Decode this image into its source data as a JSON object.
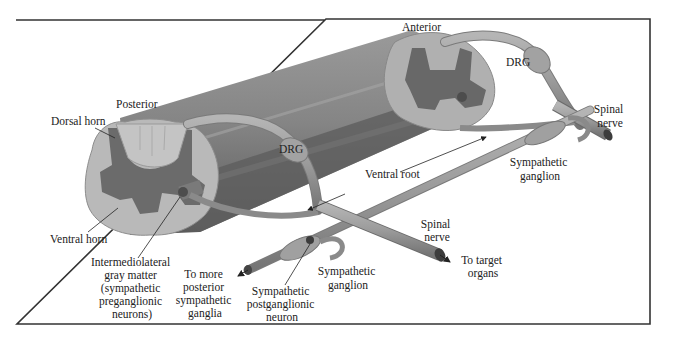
{
  "figure": {
    "colors": {
      "frame": "#333333",
      "white_matter": "#b9b9b9",
      "gray_matter": "#6e6e6e",
      "cord_body": "#8c8c8c",
      "cord_dark": "#5f5f5f",
      "nerve": "#9a9a9a",
      "nerve_edge": "#6a6a6a",
      "text": "#222222"
    },
    "labels": {
      "posterior": "Posterior",
      "anterior": "Anterior",
      "dorsal_horn": "Dorsal horn",
      "ventral_horn": "Ventral horn",
      "drg_left": "DRG",
      "drg_right": "DRG",
      "ventral_root": "Ventral root",
      "spinal_nerve_top": [
        "Spinal",
        "nerve"
      ],
      "spinal_nerve_bottom": [
        "Spinal",
        "nerve"
      ],
      "sympathetic_ganglion_right": [
        "Sympathetic",
        "ganglion"
      ],
      "sympathetic_ganglion_bottom": [
        "Sympathetic",
        "ganglion"
      ],
      "intermediolateral": [
        "Intermediolateral",
        "gray matter",
        "(sympathetic",
        "preganglionic",
        "neurons)"
      ],
      "to_more_posterior": [
        "To more",
        "posterior",
        "sympathetic",
        "ganglia"
      ],
      "postganglionic": [
        "Sympathetic",
        "postganglionic",
        "neuron"
      ],
      "to_target": [
        "To target",
        "organs"
      ]
    }
  }
}
